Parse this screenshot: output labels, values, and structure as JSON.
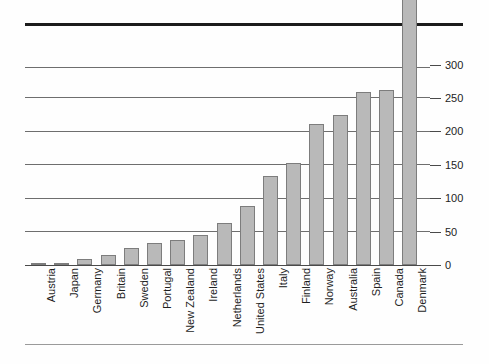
{
  "chart_data": {
    "type": "bar",
    "title": "",
    "subtitle": "",
    "xlabel": "",
    "ylabel": "",
    "ylim": [
      0,
      330
    ],
    "yticks": [
      0,
      50,
      100,
      150,
      200,
      250,
      300
    ],
    "ytick_labels": [
      "0",
      "50",
      "100",
      "150",
      "200",
      "250",
      "300"
    ],
    "grid": true,
    "legend": null,
    "legend_position": "none",
    "orientation": "vertical",
    "bar_color": "#b9b9b9",
    "bar_border_color": "#7d7d7d",
    "gridline_color": "#6e6e6e",
    "axis_side": "right",
    "categories": [
      "Austria",
      "Japan",
      "Germany",
      "Britain",
      "Sweden",
      "Portugal",
      "New Zealand",
      "Ireland",
      "Netherlands",
      "United States",
      "Italy",
      "Finland",
      "Norway",
      "Australia",
      "Spain",
      "Canada",
      "Denmark"
    ],
    "values": [
      1,
      2,
      9,
      15,
      25,
      33,
      38,
      45,
      63,
      88,
      133,
      153,
      211,
      225,
      259,
      262,
      431
    ],
    "data_labels": [
      {
        "category": "Denmark",
        "text": "431",
        "clipped": true,
        "display_height": 331
      }
    ],
    "annotations": [
      {
        "name": "top-rule",
        "type": "horizontal-rule",
        "weight": "thick",
        "color": "#1c1c1c"
      },
      {
        "name": "bottom-rule",
        "type": "horizontal-rule",
        "weight": "thin",
        "color": "#9a9a9a"
      }
    ]
  }
}
